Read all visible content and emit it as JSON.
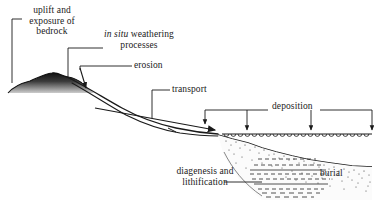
{
  "figure": {
    "kind": "geological-cross-section",
    "title_visible": false,
    "background_color": "#ffffff",
    "ink_color": "#1a1a1a"
  },
  "labels": {
    "uplift": {
      "line1": "uplift and",
      "line2": "exposure of",
      "line3": "bedrock"
    },
    "weathering": {
      "emphasis": "in situ",
      "rest": " weathering",
      "line2": "processes"
    },
    "erosion": "erosion",
    "transport": "transport",
    "deposition": "deposition",
    "burial": "burial",
    "diagenesis": {
      "line1": "diagenesis and",
      "line2": "lithification"
    }
  },
  "features": {
    "bedrock_mound": "dark shaded bedrock mound at left",
    "river_channel": "two parallel lines descending right from mound",
    "water_surface": "horizontal line with scalloped wave symbols",
    "sediment_wedge": "stippled sediment wedge below water",
    "lithified_layers": "horizontal dashed strata inside sediment wedge",
    "flow_arrow": "rightward arrow along channel",
    "deposition_arrows": 3
  },
  "colors": {
    "ink": "#1a1a1a",
    "bedrock_dark": "#111111",
    "bedrock_light": "#b8b8b8",
    "stipple": "#2a2a2a",
    "paper": "#ffffff"
  }
}
